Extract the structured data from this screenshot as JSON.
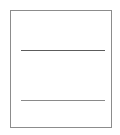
{
  "page": {
    "width": 120,
    "height": 135,
    "background_color": "#ffffff"
  },
  "frame": {
    "name": "document-outline",
    "x": 10,
    "y": 10,
    "width": 100,
    "height": 116,
    "border_color": "#8c8c8c",
    "border_width": 1,
    "fill_color": "#ffffff"
  },
  "rules": [
    {
      "name": "divider-rule-top",
      "x": 21,
      "y": 50,
      "length": 84,
      "thickness": 1,
      "color": "#5c5c5c"
    },
    {
      "name": "divider-rule-bottom",
      "x": 21,
      "y": 100,
      "length": 84,
      "thickness": 1,
      "color": "#8a8a8a"
    }
  ],
  "regions": [
    {
      "name": "region-top",
      "label": "",
      "content": ""
    },
    {
      "name": "region-middle",
      "label": "",
      "content": ""
    },
    {
      "name": "region-bottom",
      "label": "",
      "content": ""
    }
  ]
}
